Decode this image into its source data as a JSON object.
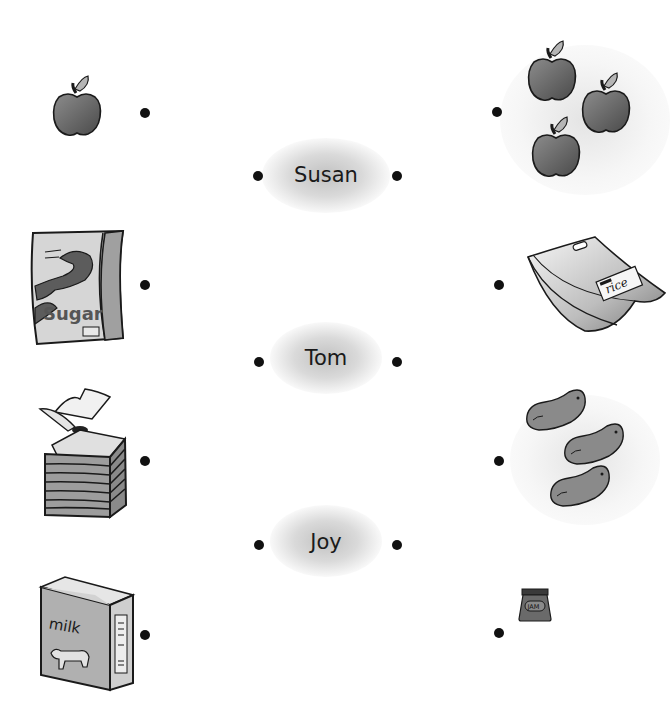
{
  "worksheet": {
    "type": "matching exercise",
    "names": [
      {
        "label": "Susan"
      },
      {
        "label": "Tom"
      },
      {
        "label": "Joy"
      }
    ],
    "left_items": [
      {
        "item": "apple",
        "count": 1
      },
      {
        "item": "sugar bag",
        "text": "Sugar"
      },
      {
        "item": "sliced bread"
      },
      {
        "item": "milk carton",
        "text": "milk"
      }
    ],
    "right_items": [
      {
        "item": "apples",
        "count": 3
      },
      {
        "item": "rice bag",
        "text": "rice"
      },
      {
        "item": "beans",
        "count": 3
      },
      {
        "item": "jam jar",
        "text": "jam"
      }
    ]
  },
  "colors": {
    "dot": "#111111",
    "outline": "#1a1a1a",
    "fill_dark": "#6e6e6e",
    "fill_mid": "#9a9a9a",
    "fill_light": "#d8d8d8"
  }
}
